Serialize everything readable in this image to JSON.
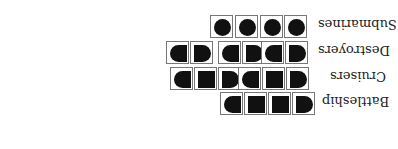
{
  "rows": [
    {
      "label": "Submarines",
      "ship_length": 1,
      "count": 4
    },
    {
      "label": "Destroyers",
      "ship_length": 2,
      "count": 3
    },
    {
      "label": "Cruisers",
      "ship_length": 3,
      "count": 2
    },
    {
      "label": "Battleship",
      "ship_length": 4,
      "count": 1
    }
  ],
  "orientation": "rotated-180"
}
